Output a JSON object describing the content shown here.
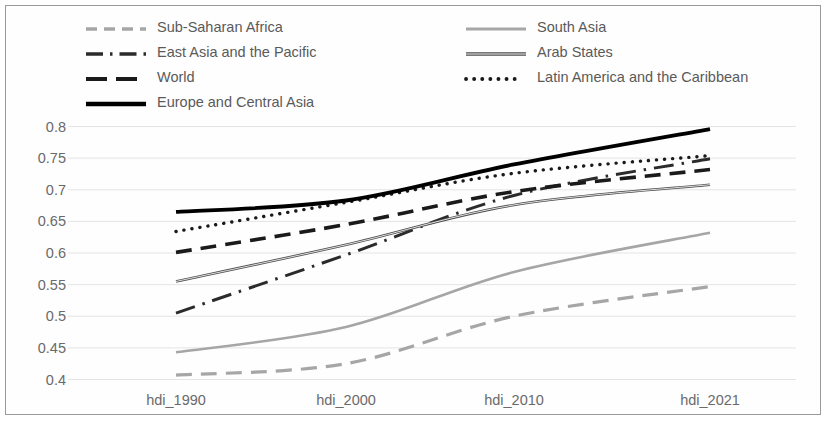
{
  "chart_data": {
    "type": "line",
    "title": "",
    "xlabel": "",
    "ylabel": "",
    "categories": [
      "hdi_1990",
      "hdi_2000",
      "hdi_2010",
      "hdi_2021"
    ],
    "ylim": [
      0.4,
      0.8
    ],
    "yticks": [
      "0.4",
      "0.45",
      "0.5",
      "0.55",
      "0.6",
      "0.65",
      "0.7",
      "0.75",
      "0.8"
    ],
    "ytick_values": [
      0.4,
      0.45,
      0.5,
      0.55,
      0.6,
      0.65,
      0.7,
      0.75,
      0.8
    ],
    "grid": true,
    "legend_position": "top",
    "series": [
      {
        "name": "Sub-Saharan Africa",
        "values": [
          0.407,
          0.425,
          0.5,
          0.547
        ],
        "color": "#a6a6a6",
        "style": "dashed",
        "width": 3.2
      },
      {
        "name": "South Asia",
        "values": [
          0.443,
          0.483,
          0.57,
          0.632
        ],
        "color": "#a6a6a6",
        "style": "solid",
        "width": 2.6
      },
      {
        "name": "East Asia and the Pacific",
        "values": [
          0.505,
          0.597,
          0.691,
          0.749
        ],
        "color": "#2b2b2b",
        "style": "dashdot",
        "width": 3.0
      },
      {
        "name": "Arab States",
        "values": [
          0.555,
          0.613,
          0.676,
          0.708
        ],
        "color": "#4d4d4d",
        "style": "solid",
        "width": 2.6
      },
      {
        "name": "World",
        "values": [
          0.601,
          0.645,
          0.697,
          0.732
        ],
        "color": "#1a1a1a",
        "style": "dashed",
        "width": 3.6
      },
      {
        "name": "Latin America and the Caribbean",
        "values": [
          0.634,
          0.68,
          0.726,
          0.754
        ],
        "color": "#1a1a1a",
        "style": "dotted",
        "width": 3.4
      },
      {
        "name": "Europe and Central Asia",
        "values": [
          0.665,
          0.683,
          0.74,
          0.796
        ],
        "color": "#000000",
        "style": "solid",
        "width": 3.8
      }
    ]
  },
  "legend": {
    "left_column": [
      {
        "label": "Sub-Saharan Africa",
        "key": "dashed-gray-line-key"
      },
      {
        "label": "East Asia and the Pacific",
        "key": "dashdot-black-line-key"
      },
      {
        "label": "World",
        "key": "dashed-black-line-key"
      },
      {
        "label": "Europe and Central Asia",
        "key": "solid-black-line-key"
      }
    ],
    "right_column": [
      {
        "label": "South Asia",
        "key": "solid-gray-line-key"
      },
      {
        "label": "Arab States",
        "key": "solid-darkgray-line-key"
      },
      {
        "label": "Latin America and the Caribbean",
        "key": "dotted-black-line-key"
      }
    ]
  },
  "colors": {
    "frame_border": "#9a9a9a",
    "gridline": "#e4e4e4",
    "tick_text": "#6a6a6a",
    "legend_text": "#5a5a5a",
    "background": "#ffffff"
  }
}
